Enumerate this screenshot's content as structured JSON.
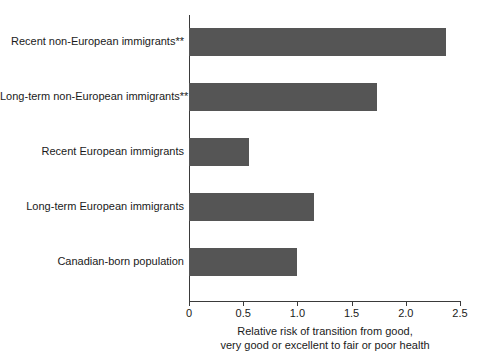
{
  "chart_data": {
    "type": "bar",
    "orientation": "horizontal",
    "title": "",
    "xlabel_line1": "Relative risk of transition from good,",
    "xlabel_line2": "very good or excellent to fair or poor health",
    "ylabel": "",
    "xlim": [
      0,
      2.5
    ],
    "grid": false,
    "legend": false,
    "bar_color": "#555555",
    "axis_color": "#3a3a3a",
    "categories": [
      "Recent non-European immigrants**",
      "Long-term non-European immigrants**",
      "Recent European immigrants",
      "Long-term European immigrants",
      "Canadian-born population"
    ],
    "values": [
      2.37,
      1.73,
      0.55,
      1.15,
      1.0
    ],
    "xticks": [
      0,
      0.5,
      1.0,
      1.5,
      2.0,
      2.5
    ],
    "xticklabels": [
      "0",
      "0.5",
      "1.0",
      "1.5",
      "2.0",
      "2.5"
    ]
  }
}
